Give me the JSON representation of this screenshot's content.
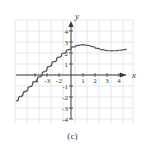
{
  "figure": {
    "caption": "(c)",
    "axis_label_x": "x",
    "axis_label_y": "y"
  },
  "colors": {
    "grid": "#dcdce4",
    "axis": "#3a3a3a",
    "curve": "#5a5a62",
    "tick_text": "#2f2f2f",
    "background": "#ffffff"
  },
  "chart_data": {
    "type": "line",
    "title": "",
    "xlabel": "x",
    "ylabel": "y",
    "xlim": [
      -5,
      5.4
    ],
    "ylim": [
      -4.5,
      4.5
    ],
    "grid": true,
    "legend": null,
    "xticks": [
      -4,
      -3,
      -2,
      -1,
      1,
      2,
      3,
      4
    ],
    "xtick_labels": [
      "-4",
      "-3",
      "-2",
      "-1",
      "1",
      "2",
      "3",
      "4"
    ],
    "yticks": [
      4,
      3,
      2,
      1,
      -1,
      -2,
      -3,
      -4
    ],
    "ytick_labels": [
      "4",
      "3",
      "2",
      "1",
      "-1",
      "-2",
      "-3",
      "-4"
    ],
    "series": [
      {
        "name": "f(x)",
        "x": [
          -4.55,
          -4.2,
          -3.8,
          -3.4,
          -3.0,
          -2.6,
          -2.2,
          -1.8,
          -1.4,
          -1.0,
          -0.6,
          -0.2,
          0.2,
          0.6,
          1.0,
          1.4,
          1.8,
          2.2,
          2.6,
          3.0,
          3.4,
          3.8,
          4.2,
          4.6
        ],
        "y": [
          -2.35,
          -1.95,
          -1.5,
          -1.05,
          -0.6,
          -0.15,
          0.3,
          0.78,
          1.22,
          1.62,
          1.98,
          2.3,
          2.55,
          2.7,
          2.75,
          2.7,
          2.58,
          2.42,
          2.3,
          2.22,
          2.2,
          2.22,
          2.27,
          2.32
        ]
      }
    ],
    "annotations": [
      {
        "text": "x-intercept near x = -3"
      },
      {
        "text": "local maximum near (1, 2.75)"
      },
      {
        "text": "local minimum near (3.4, 2.2)"
      }
    ]
  },
  "ticks": {
    "x_negative": [
      "-4",
      "-3",
      "-2",
      "-1"
    ],
    "x_positive": [
      "1",
      "2",
      "3",
      "4"
    ],
    "y_positive": [
      "4",
      "3",
      "2",
      "1"
    ],
    "y_negative": [
      "-1",
      "-2",
      "-3",
      "-4"
    ]
  }
}
